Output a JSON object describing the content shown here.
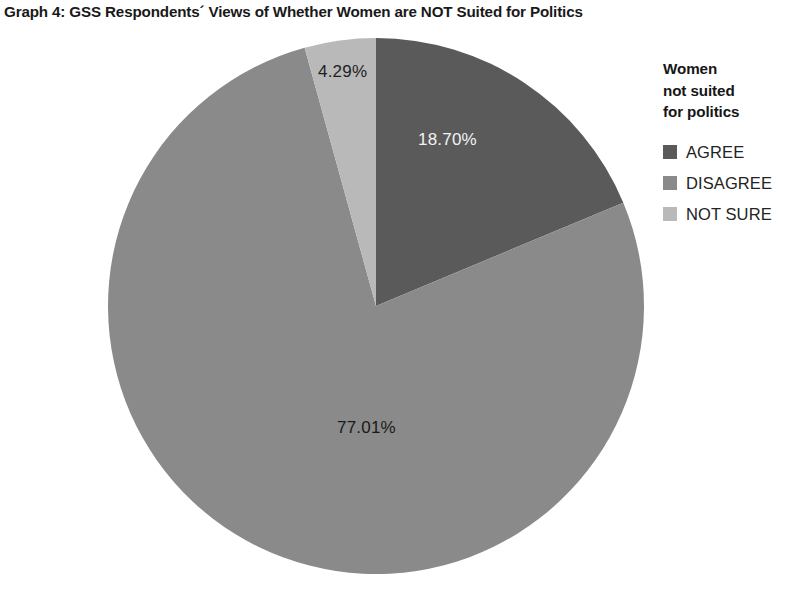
{
  "chart_data": {
    "type": "pie",
    "title": "Graph 4: GSS Respondents´ Views of Whether Women are NOT Suited for Politics",
    "xlabel": "",
    "ylabel": "",
    "grid": false,
    "legend_position": "right",
    "legend_title": "Women not suited for politics",
    "legend_title_lines": [
      "Women",
      "not suited",
      "for politics"
    ],
    "categories": [
      "AGREE",
      "DISAGREE",
      "NOT SURE"
    ],
    "values": [
      18.7,
      77.01,
      4.29
    ],
    "value_labels": [
      "18.70%",
      "77.01%",
      "4.29%"
    ],
    "units": "percent",
    "start_angle_deg": 0,
    "direction": "clockwise",
    "colors": [
      "#5a5a5a",
      "#8a8a8a",
      "#b9b9b9"
    ],
    "label_text_colors": [
      "#f2f2f2",
      "#1a1a1a",
      "#1f1f1f"
    ],
    "slices": [
      {
        "name": "AGREE",
        "value": 18.7,
        "label": "18.70%",
        "color": "#5a5a5a"
      },
      {
        "name": "DISAGREE",
        "value": 77.01,
        "label": "77.01%",
        "color": "#8a8a8a"
      },
      {
        "name": "NOT SURE",
        "value": 4.29,
        "label": "4.29%",
        "color": "#b9b9b9"
      }
    ]
  },
  "title": {
    "text": "Graph 4: GSS Respondents´ Views of Whether Women are NOT Suited for Politics"
  },
  "legend": {
    "title_line_1": "Women",
    "title_line_2": "not suited",
    "title_line_3": "for politics",
    "items": [
      {
        "label": "AGREE",
        "color": "#5a5a5a"
      },
      {
        "label": "DISAGREE",
        "color": "#8a8a8a"
      },
      {
        "label": "NOT SURE",
        "color": "#b9b9b9"
      }
    ]
  },
  "labels": {
    "agree": "18.70%",
    "disagree": "77.01%",
    "not_sure": "4.29%"
  }
}
